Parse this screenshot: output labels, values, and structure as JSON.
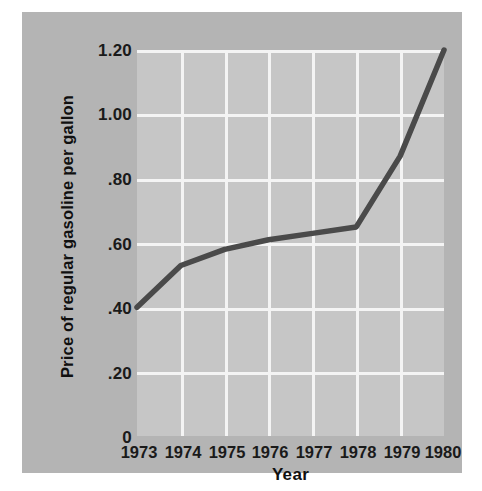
{
  "chart_data": {
    "type": "line",
    "title": "",
    "subtitle": "",
    "xlabel": "Year",
    "ylabel": "Price of regular gasoline per gallon",
    "x": [
      1973,
      1974,
      1975,
      1976,
      1977,
      1978,
      1979,
      1980
    ],
    "categories": [
      "1973",
      "1974",
      "1975",
      "1976",
      "1977",
      "1978",
      "1979",
      "1980"
    ],
    "values": [
      0.4,
      0.53,
      0.58,
      0.61,
      0.63,
      0.65,
      0.87,
      1.2
    ],
    "series": [
      {
        "name": "Price of regular gasoline per gallon",
        "values": [
          0.4,
          0.53,
          0.58,
          0.61,
          0.63,
          0.65,
          0.87,
          1.2
        ]
      }
    ],
    "xlim": [
      1973,
      1980
    ],
    "ylim": [
      0,
      1.2
    ],
    "ytick_labels": [
      "1.20",
      "1.00",
      ".80",
      ".60",
      ".40",
      ".20",
      "0"
    ],
    "ytick_values": [
      1.2,
      1.0,
      0.8,
      0.6,
      0.4,
      0.2,
      0
    ],
    "xtick_labels": [
      "1973",
      "1974",
      "1975",
      "1976",
      "1977",
      "1978",
      "1979",
      "1980"
    ],
    "grid": true,
    "gridline_color": "#f4f4f4",
    "legend": null,
    "legend_position": "none",
    "annotations": []
  },
  "style": {
    "page_background": "#ffffff",
    "panel_background": "#b4b4b4",
    "plot_background": "#c6c6c6",
    "line_color": "#4a4a4a",
    "text_color": "#1a1a1a",
    "grid_color": "#f4f4f4"
  }
}
